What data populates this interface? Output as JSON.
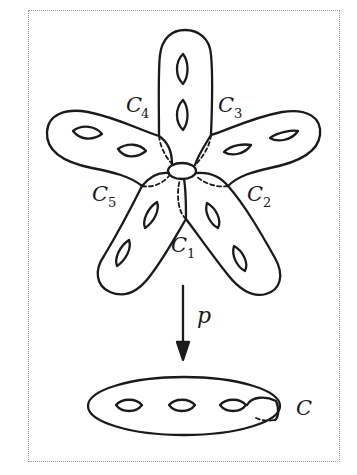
{
  "figure": {
    "colors": {
      "stroke": "#1a1a1a",
      "frame": "#9a9a9a",
      "background": "#ffffff"
    },
    "upper_surface": {
      "arms": 5,
      "holes_per_arm": 2,
      "curve_labels": [
        {
          "id": "c1",
          "letter": "C",
          "sub": "1"
        },
        {
          "id": "c2",
          "letter": "C",
          "sub": "2"
        },
        {
          "id": "c3",
          "letter": "C",
          "sub": "3"
        },
        {
          "id": "c4",
          "letter": "C",
          "sub": "4"
        },
        {
          "id": "c5",
          "letter": "C",
          "sub": "5"
        }
      ]
    },
    "map": {
      "label": "p",
      "direction": "down"
    },
    "lower_surface": {
      "holes": 3,
      "curve_label": "C"
    }
  }
}
